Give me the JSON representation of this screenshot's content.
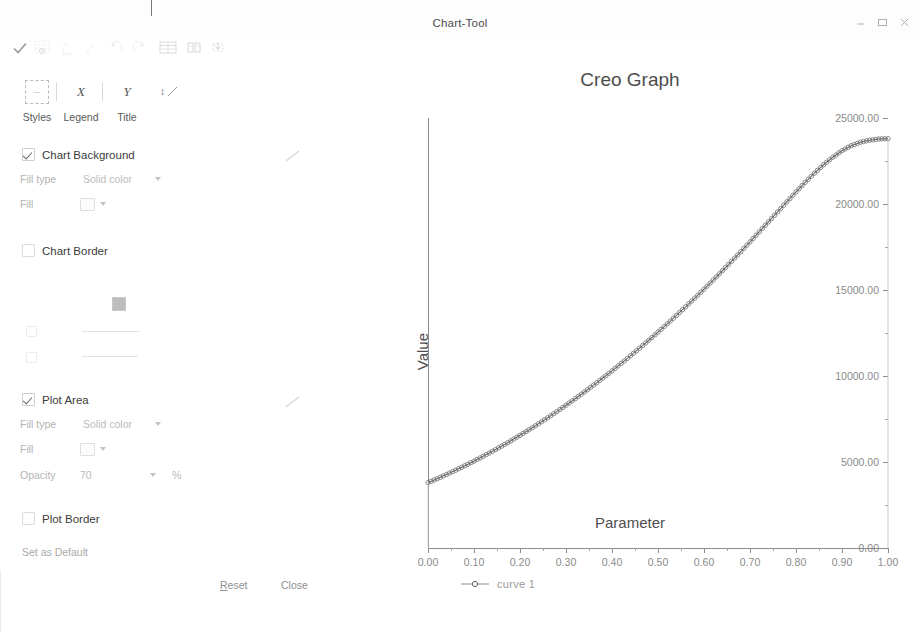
{
  "window": {
    "title": "Chart-Tool",
    "controls": [
      {
        "name": "minimize",
        "glyph": "minimize-icon"
      },
      {
        "name": "maximize",
        "glyph": "maximize-icon"
      },
      {
        "name": "close",
        "glyph": "close-icon"
      }
    ]
  },
  "toolbar": {
    "items": [
      {
        "name": "apply-check-icon"
      },
      {
        "name": "grid-visibility-icon"
      },
      {
        "name": "axis-properties-icon"
      },
      {
        "name": "format-icon"
      },
      {
        "name": "undo-icon"
      },
      {
        "name": "redo-icon"
      },
      {
        "name": "table-icon"
      },
      {
        "name": "data-series-icon"
      },
      {
        "name": "export-icon"
      }
    ]
  },
  "tabs": [
    {
      "label": "Styles",
      "icon": "styles-icon",
      "selected": true
    },
    {
      "label": "Legend",
      "icon": "x-axis-icon",
      "selected": false
    },
    {
      "label": "Title",
      "icon": "y-axis-icon",
      "selected": false
    }
  ],
  "sections": {
    "chart_background": {
      "label": "Chart Background",
      "checked": true,
      "fill_type_label": "Fill type",
      "fill_type_value": "Solid color",
      "fill_label": "Fill"
    },
    "chart_border": {
      "label": "Chart Border",
      "checked": false
    },
    "plot_area": {
      "label": "Plot Area",
      "checked": true,
      "fill_type_label": "Fill type",
      "fill_type_value": "Solid color",
      "fill_label": "Fill",
      "opacity_label": "Opacity",
      "opacity_value": "70",
      "opacity_unit": "%"
    },
    "plot_border": {
      "label": "Plot Border",
      "checked": false
    }
  },
  "footer": {
    "set_default": "Set as Default",
    "reset": "Reset",
    "reset_mnemonic": "R",
    "close": "Close"
  },
  "chart_data": {
    "type": "line",
    "title": "Creo Graph",
    "xlabel": "Parameter",
    "ylabel": "Value",
    "xlim": [
      0.0,
      1.0
    ],
    "ylim": [
      0.0,
      25000.0
    ],
    "xticks": [
      "0.00",
      "0.10",
      "0.20",
      "0.30",
      "0.40",
      "0.50",
      "0.60",
      "0.70",
      "0.80",
      "0.90",
      "1.00"
    ],
    "xtick_values": [
      0.0,
      0.1,
      0.2,
      0.3,
      0.4,
      0.5,
      0.6,
      0.7,
      0.8,
      0.9,
      1.0
    ],
    "yticks": [
      "0.00",
      "5000.00",
      "10000.00",
      "15000.00",
      "20000.00",
      "25000.00"
    ],
    "ytick_values": [
      0,
      5000,
      10000,
      15000,
      20000,
      25000
    ],
    "grid": false,
    "legend_position": "bottom-left",
    "marker": "circle",
    "line_color": "#666666",
    "series": [
      {
        "name": "curve  1",
        "x": [
          0.0,
          0.02,
          0.04,
          0.06,
          0.08,
          0.1,
          0.12,
          0.14,
          0.16,
          0.18,
          0.2,
          0.22,
          0.24,
          0.26,
          0.28,
          0.3,
          0.32,
          0.34,
          0.36,
          0.38,
          0.4,
          0.42,
          0.44,
          0.46,
          0.48,
          0.5,
          0.52,
          0.54,
          0.56,
          0.58,
          0.6,
          0.62,
          0.64,
          0.66,
          0.68,
          0.7,
          0.72,
          0.74,
          0.76,
          0.78,
          0.8,
          0.82,
          0.84,
          0.86,
          0.88,
          0.9,
          0.92,
          0.94,
          0.96,
          0.98,
          1.0
        ],
        "y": [
          3800,
          4030,
          4270,
          4520,
          4780,
          5050,
          5330,
          5620,
          5920,
          6230,
          6550,
          6880,
          7220,
          7570,
          7930,
          8300,
          8680,
          9070,
          9470,
          9880,
          10300,
          10730,
          11170,
          11620,
          12080,
          12550,
          13030,
          13520,
          14020,
          14530,
          15050,
          15580,
          16120,
          16670,
          17230,
          17800,
          18380,
          18960,
          19540,
          20120,
          20700,
          21260,
          21790,
          22280,
          22720,
          23100,
          23390,
          23590,
          23710,
          23780,
          23800
        ]
      }
    ],
    "drop_line_x": 1.0
  }
}
